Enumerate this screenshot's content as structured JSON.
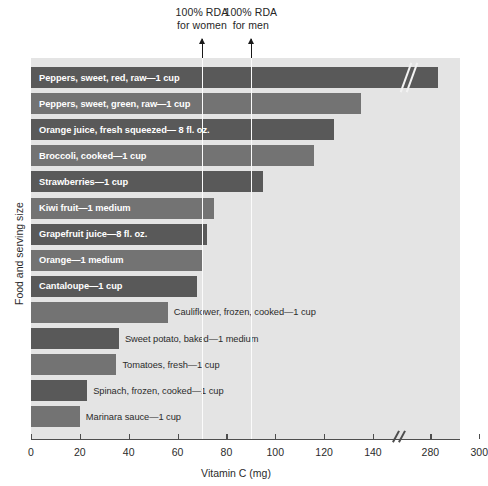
{
  "chart": {
    "type": "bar",
    "title": "",
    "xlabel": "Vitamin C (mg)",
    "ylabel": "Food and serving size",
    "orientation": "horizontal",
    "grid": false,
    "legend": "none",
    "axis_break": {
      "from": 145,
      "to": 275,
      "label": "//"
    },
    "xlim": [
      0,
      300
    ],
    "xticks": [
      0,
      20,
      40,
      60,
      80,
      100,
      120,
      140,
      280,
      300
    ],
    "xtick_labels": [
      "0",
      "20",
      "40",
      "60",
      "80",
      "100",
      "120",
      "140",
      "280",
      "300"
    ],
    "annotations": [
      {
        "name": "rda-women",
        "text": "100% RDA\nfor women",
        "value": 70,
        "line": true
      },
      {
        "name": "rda-men",
        "text": "100% RDA\nfor men",
        "value": 90,
        "line": true
      }
    ],
    "categories": [
      "Peppers, sweet, red, raw—1 cup",
      "Peppers, sweet, green, raw—1 cup",
      "Orange juice, fresh squeezed— 8 fl. oz.",
      "Broccoli, cooked—1 cup",
      "Strawberries—1 cup",
      "Kiwi fruit—1 medium",
      "Grapefruit juice—8 fl. oz.",
      "Orange—1 medium",
      "Cantaloupe—1 cup",
      "Cauliflower, frozen, cooked—1 cup",
      "Sweet potato, baked—1 medium",
      "Tomatoes, fresh—1 cup",
      "Spinach, frozen, cooked—1 cup",
      "Marinara sauce—1 cup"
    ],
    "values": [
      283,
      135,
      124,
      116,
      95,
      75,
      72,
      70,
      68,
      56,
      36,
      35,
      23,
      20
    ],
    "bars": [
      {
        "label": "Peppers, sweet, red, raw—1 cup",
        "value": 283,
        "label_inside": true,
        "color": "#595959",
        "broken": true
      },
      {
        "label": "Peppers, sweet, green, raw—1 cup",
        "value": 135,
        "label_inside": true,
        "color": "#737373",
        "broken": false
      },
      {
        "label": "Orange juice, fresh squeezed— 8 fl. oz.",
        "value": 124,
        "label_inside": true,
        "color": "#595959",
        "broken": false
      },
      {
        "label": "Broccoli, cooked—1 cup",
        "value": 116,
        "label_inside": true,
        "color": "#737373",
        "broken": false
      },
      {
        "label": "Strawberries—1 cup",
        "value": 95,
        "label_inside": true,
        "color": "#595959",
        "broken": false
      },
      {
        "label": "Kiwi fruit—1 medium",
        "value": 75,
        "label_inside": true,
        "color": "#737373",
        "broken": false
      },
      {
        "label": "Grapefruit juice—8 fl. oz.",
        "value": 72,
        "label_inside": true,
        "color": "#595959",
        "broken": false
      },
      {
        "label": "Orange—1 medium",
        "value": 70,
        "label_inside": true,
        "color": "#737373",
        "broken": false
      },
      {
        "label": "Cantaloupe—1 cup",
        "value": 68,
        "label_inside": true,
        "color": "#595959",
        "broken": false
      },
      {
        "label": "Cauliflower, frozen, cooked—1 cup",
        "value": 56,
        "label_inside": false,
        "color": "#737373",
        "broken": false
      },
      {
        "label": "Sweet potato, baked—1 medium",
        "value": 36,
        "label_inside": false,
        "color": "#595959",
        "broken": false
      },
      {
        "label": "Tomatoes, fresh—1 cup",
        "value": 35,
        "label_inside": false,
        "color": "#737373",
        "broken": false
      },
      {
        "label": "Spinach, frozen, cooked—1 cup",
        "value": 23,
        "label_inside": false,
        "color": "#595959",
        "broken": false
      },
      {
        "label": "Marinara sauce—1 cup",
        "value": 20,
        "label_inside": false,
        "color": "#737373",
        "broken": false
      }
    ],
    "colors": {
      "plot_background": "#e4e4e4",
      "bar_dark": "#595959",
      "bar_light": "#737373",
      "axis": "#4d4d4d",
      "rda_line": "#fbfbfb",
      "text": "#2b2b2b",
      "label_inside": "#ffffff"
    }
  }
}
